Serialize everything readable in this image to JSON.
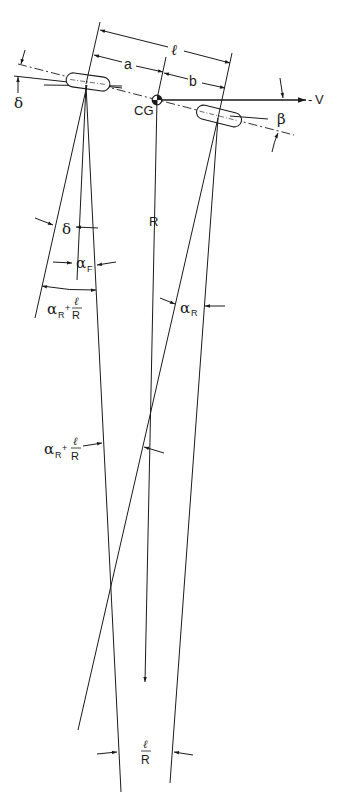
{
  "figure": {
    "labels": {
      "wheelbase": "ℓ",
      "front_distance": "a",
      "rear_distance": "b",
      "cg": "CG",
      "velocity": "V",
      "velocity_prefix": "-",
      "sideslip": "β",
      "steer_angle_top": "δ",
      "steer_angle_mid": "δ",
      "radius": "R",
      "front_slip": "α",
      "front_slip_sub": "F",
      "rear_slip": "α",
      "rear_slip_sub": "R",
      "alpha_r_plus_l_over_r_1": {
        "alpha": "α",
        "sub": "R",
        "plus": "+",
        "num": "ℓ",
        "den": "R"
      },
      "alpha_r_plus_l_over_r_2": {
        "alpha": "α",
        "sub": "R",
        "plus": "+",
        "num": "ℓ",
        "den": "R"
      },
      "l_over_r": {
        "num": "ℓ",
        "den": "R"
      }
    },
    "colors": {
      "ink": "#1a1a1a",
      "background": "#ffffff"
    }
  }
}
